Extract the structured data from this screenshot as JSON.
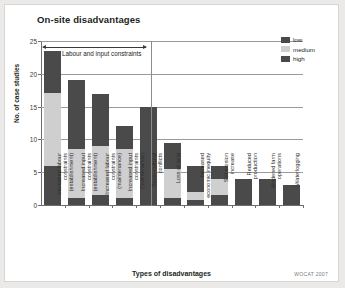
{
  "chart_data": {
    "type": "bar",
    "title": "On-site disadvantages",
    "xlabel": "Types of disadvantages",
    "ylabel": "No. of case studies",
    "ylim": [
      0,
      25
    ],
    "yticks": [
      0,
      5,
      10,
      15,
      20,
      25
    ],
    "grid": true,
    "stacked": true,
    "legend_position": "top-right",
    "legend": [
      {
        "name": "low",
        "color": "#4a4a4a"
      },
      {
        "name": "medium",
        "color": "#cfcfcf"
      },
      {
        "name": "high",
        "color": "#4a4a4a"
      }
    ],
    "categories": [
      "Increased labour constraints (establishment)",
      "Increased input constraints (establishment)",
      "Increased labour constraints (maintenance)",
      "Increased input constraints (maintenance)",
      "Socio-cultural conflicts",
      "Loss of land",
      "Increased economic inequity",
      "Soil erosion increase",
      "Reduced production",
      "Hindered farm operations",
      "Waterlogging"
    ],
    "category_lines": [
      [
        "Increased labour",
        "constraints",
        "(establishment)"
      ],
      [
        "Increased input",
        "constraints",
        "(establishment)"
      ],
      [
        "Increased labour",
        "constraints",
        "(maintenance)"
      ],
      [
        "Increased input",
        "constraints",
        "(maintenance)"
      ],
      [
        "Socio-cultural",
        "conflicts"
      ],
      [
        "Loss of land"
      ],
      [
        "Increased",
        "economic inequity"
      ],
      [
        "Soil erosion",
        "increase"
      ],
      [
        "Reduced",
        "production"
      ],
      [
        "Hindered farm",
        "operations"
      ],
      [
        "Waterlogging"
      ]
    ],
    "series": [
      {
        "name": "low",
        "values": [
          6,
          1,
          1.5,
          1,
          2,
          1,
          0.7,
          1.5,
          0,
          0,
          0
        ]
      },
      {
        "name": "medium",
        "values": [
          11,
          7.5,
          7.5,
          7.5,
          0,
          4.5,
          1.3,
          2.5,
          0,
          0,
          0
        ]
      },
      {
        "name": "high",
        "values": [
          6.5,
          10.5,
          8,
          3.5,
          13,
          4,
          4,
          2,
          4,
          4,
          3
        ]
      }
    ],
    "totals": [
      23.5,
      19,
      17,
      12,
      15,
      9.5,
      6,
      6,
      4,
      4,
      3
    ],
    "annotations": [
      {
        "text": "Labour and input constraints",
        "spans_categories": [
          1,
          4
        ],
        "style": "double-arrow"
      }
    ]
  },
  "footer": {
    "credit": "WOCAT 2007"
  }
}
